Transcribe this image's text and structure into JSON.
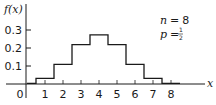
{
  "chart_data": {
    "type": "bar",
    "style": "step",
    "title": "",
    "xlabel": "x",
    "ylabel": "f(x)",
    "categories": [
      "0",
      "1",
      "2",
      "3",
      "4",
      "5",
      "6",
      "7",
      "8"
    ],
    "x": [
      0,
      1,
      2,
      3,
      4,
      5,
      6,
      7,
      8
    ],
    "values": [
      0.0039,
      0.0313,
      0.1094,
      0.2188,
      0.2734,
      0.2188,
      0.1094,
      0.0313,
      0.0039
    ],
    "x_ticks": [
      "0",
      "1",
      "2",
      "3",
      "4",
      "5",
      "6",
      "7",
      "8"
    ],
    "y_ticks": [
      "0.1",
      "0.2",
      "0.3"
    ],
    "ylim": [
      0,
      0.35
    ],
    "xlim": [
      0,
      9
    ],
    "grid": false,
    "legend": null,
    "annotations": [
      {
        "label": "n",
        "eq": "=",
        "value": "8"
      },
      {
        "label": "p",
        "eq": "=",
        "value_num": "1",
        "value_den": "2"
      }
    ]
  },
  "axes": {
    "y_title": "f(x)",
    "x_title": "x",
    "origin_label": "0"
  },
  "colors": {
    "ink": "#1a1a1a",
    "background": "#ffffff"
  }
}
